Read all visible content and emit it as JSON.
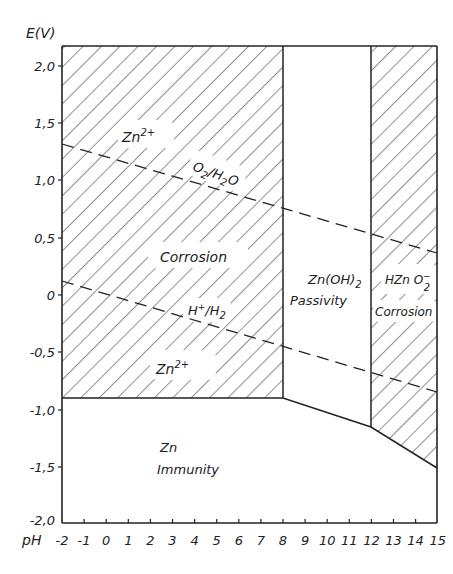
{
  "chart_data": {
    "type": "diagram",
    "title": "",
    "xlabel": "pH",
    "ylabel": "E(V)",
    "xlim": [
      -2,
      15
    ],
    "ylim": [
      -2.0,
      2.17
    ],
    "x_ticks": [
      "-2",
      "-1",
      "0",
      "1",
      "2",
      "3",
      "4",
      "5",
      "6",
      "7",
      "8",
      "9",
      "10",
      "11",
      "12",
      "13",
      "14",
      "15"
    ],
    "y_ticks": [
      "2,0",
      "1,5",
      "1,0",
      "0,5",
      "0",
      "-0,5",
      "-1,0",
      "-1,5",
      "-2,0"
    ],
    "y_tick_values": [
      2.0,
      1.5,
      1.0,
      0.5,
      0,
      -0.5,
      -1.0,
      -1.5,
      -2.0
    ],
    "regions": [
      {
        "name": "Corrosion (Zn2+)",
        "pH_range": [
          -2,
          8
        ],
        "E_lower": -0.9,
        "hatched": true,
        "labels": [
          "Zn2+",
          "Corrosion",
          "Zn2+"
        ]
      },
      {
        "name": "Passivity (Zn(OH)2)",
        "pH_range": [
          8,
          12
        ],
        "E_lower_boundary": [
          [
            8,
            -0.9
          ],
          [
            12,
            -1.15
          ]
        ],
        "hatched": false,
        "labels": [
          "Zn(OH)2",
          "Passivity"
        ]
      },
      {
        "name": "Corrosion (HZnO2-)",
        "pH_range": [
          12,
          15
        ],
        "E_lower_boundary": [
          [
            12,
            -1.15
          ],
          [
            15,
            -1.51
          ]
        ],
        "hatched": true,
        "labels": [
          "HZnO2-",
          "Corrosion"
        ]
      },
      {
        "name": "Immunity (Zn)",
        "below_boundary": [
          [
            -2,
            -0.9
          ],
          [
            8,
            -0.9
          ],
          [
            12,
            -1.15
          ],
          [
            15,
            -1.51
          ]
        ],
        "hatched": false,
        "labels": [
          "Zn",
          "Immunity"
        ]
      }
    ],
    "lines": [
      {
        "name": "O2/H2O",
        "style": "dashed",
        "points": [
          [
            -2,
            1.32
          ],
          [
            15,
            0.37
          ]
        ]
      },
      {
        "name": "H+/H2",
        "style": "dashed",
        "points": [
          [
            -2,
            0.12
          ],
          [
            15,
            -0.85
          ]
        ]
      }
    ],
    "grid": false,
    "legend": "none"
  },
  "labels": {
    "y_axis": "E(V)",
    "x_axis": "pH",
    "zn2_top": "Zn",
    "zn2_top_sup": "2+",
    "o2_h2o_a": "O",
    "o2_h2o_sub1": "2",
    "o2_h2o_b": "/H",
    "o2_h2o_sub2": "2",
    "o2_h2o_c": "O",
    "corrosion_left": "Corrosion",
    "h_h2_a": "H",
    "h_h2_sup": "+",
    "h_h2_b": "/H",
    "h_h2_sub": "2",
    "zn2_bottom": "Zn",
    "zn2_bottom_sup": "2+",
    "znoh2_a": "Zn(OH)",
    "znoh2_sub": "2",
    "passivity": "Passivity",
    "hzno2_a": "HZn O",
    "hzno2_sup": "−",
    "hzno2_sub": "2",
    "corrosion_right": "Corrosion",
    "zn_immunity_a": "Zn",
    "immunity": "Immunity"
  }
}
